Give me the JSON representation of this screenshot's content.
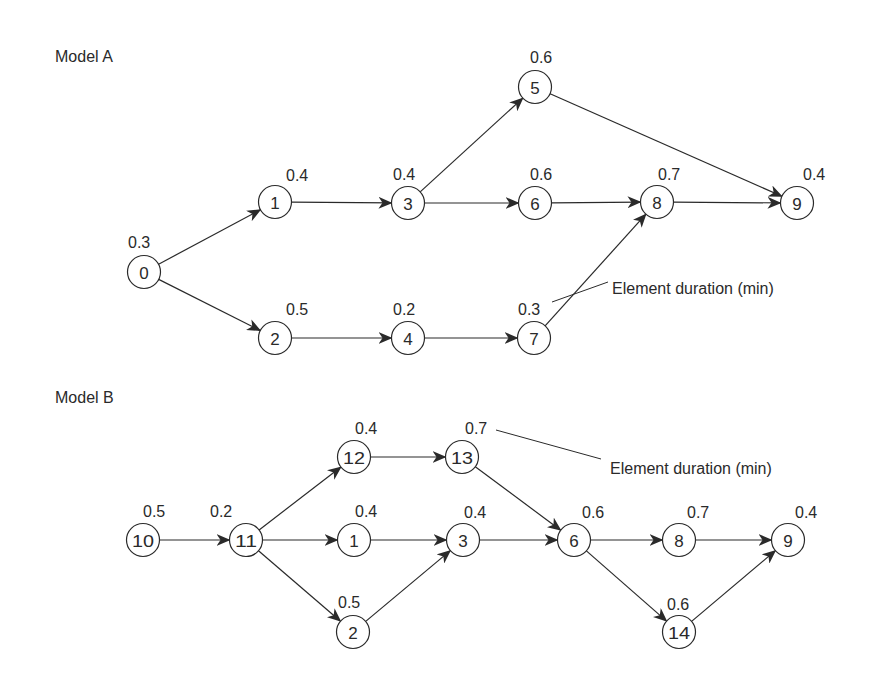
{
  "colors": {
    "ink": "#2a2a2a",
    "background": "#ffffff"
  },
  "node_radius": 16.5,
  "models": [
    {
      "id": "A",
      "title": "Model A",
      "title_pos": [
        55,
        62
      ],
      "nodes": [
        {
          "id": "0",
          "x": 144,
          "y": 272,
          "duration": "0.3",
          "label_pos": [
            128,
            248
          ]
        },
        {
          "id": "1",
          "x": 275,
          "y": 202,
          "duration": "0.4",
          "label_pos": [
            286,
            181
          ]
        },
        {
          "id": "2",
          "x": 275,
          "y": 338,
          "duration": "0.5",
          "label_pos": [
            286,
            315
          ]
        },
        {
          "id": "3",
          "x": 408,
          "y": 203,
          "duration": "0.4",
          "label_pos": [
            393,
            180
          ]
        },
        {
          "id": "4",
          "x": 408,
          "y": 338,
          "duration": "0.2",
          "label_pos": [
            393,
            315
          ]
        },
        {
          "id": "5",
          "x": 535,
          "y": 87,
          "duration": "0.6",
          "label_pos": [
            530,
            63
          ]
        },
        {
          "id": "6",
          "x": 535,
          "y": 203,
          "duration": "0.6",
          "label_pos": [
            530,
            180
          ]
        },
        {
          "id": "7",
          "x": 534,
          "y": 338,
          "duration": "0.3",
          "label_pos": [
            518,
            315
          ]
        },
        {
          "id": "8",
          "x": 657,
          "y": 202,
          "duration": "0.7",
          "label_pos": [
            658,
            180
          ]
        },
        {
          "id": "9",
          "x": 797,
          "y": 203,
          "duration": "0.4",
          "label_pos": [
            803,
            180
          ]
        }
      ],
      "edges": [
        [
          "0",
          "1"
        ],
        [
          "0",
          "2"
        ],
        [
          "1",
          "3"
        ],
        [
          "2",
          "4"
        ],
        [
          "3",
          "5"
        ],
        [
          "3",
          "6"
        ],
        [
          "4",
          "7"
        ],
        [
          "5",
          "9"
        ],
        [
          "6",
          "8"
        ],
        [
          "7",
          "8"
        ],
        [
          "8",
          "9"
        ]
      ],
      "annotation": {
        "text": "Element duration (min)",
        "text_pos": [
          612,
          294
        ],
        "leader": [
          [
            552,
            302
          ],
          [
            608,
            282
          ]
        ]
      }
    },
    {
      "id": "B",
      "title": "Model B",
      "title_pos": [
        55,
        403
      ],
      "nodes": [
        {
          "id": "10",
          "x": 143,
          "y": 540,
          "duration": "0.5",
          "label_pos": [
            143,
            517
          ]
        },
        {
          "id": "11",
          "x": 246,
          "y": 540,
          "duration": "0.2",
          "label_pos": [
            210,
            517
          ]
        },
        {
          "id": "12",
          "x": 354,
          "y": 457,
          "duration": "0.4",
          "label_pos": [
            355,
            434
          ]
        },
        {
          "id": "1",
          "x": 354,
          "y": 540,
          "duration": "0.4",
          "label_pos": [
            355,
            517
          ]
        },
        {
          "id": "2",
          "x": 353,
          "y": 632,
          "duration": "0.5",
          "label_pos": [
            338,
            608
          ]
        },
        {
          "id": "13",
          "x": 462,
          "y": 457,
          "duration": "0.7",
          "label_pos": [
            465,
            434
          ]
        },
        {
          "id": "3",
          "x": 463,
          "y": 540,
          "duration": "0.4",
          "label_pos": [
            464,
            518
          ]
        },
        {
          "id": "6",
          "x": 574,
          "y": 540,
          "duration": "0.6",
          "label_pos": [
            582,
            518
          ]
        },
        {
          "id": "8",
          "x": 679,
          "y": 540,
          "duration": "0.7",
          "label_pos": [
            687,
            518
          ]
        },
        {
          "id": "14",
          "x": 679,
          "y": 632,
          "duration": "0.6",
          "label_pos": [
            667,
            610
          ]
        },
        {
          "id": "9",
          "x": 788,
          "y": 540,
          "duration": "0.4",
          "label_pos": [
            795,
            518
          ]
        }
      ],
      "edges": [
        [
          "10",
          "11"
        ],
        [
          "11",
          "12"
        ],
        [
          "11",
          "1"
        ],
        [
          "11",
          "2"
        ],
        [
          "12",
          "13"
        ],
        [
          "1",
          "3"
        ],
        [
          "2",
          "3"
        ],
        [
          "13",
          "6"
        ],
        [
          "3",
          "6"
        ],
        [
          "6",
          "8"
        ],
        [
          "6",
          "14"
        ],
        [
          "8",
          "9"
        ],
        [
          "14",
          "9"
        ]
      ],
      "annotation": {
        "text": "Element duration (min)",
        "text_pos": [
          610,
          474
        ],
        "leader": [
          [
            496,
            430
          ],
          [
            601,
            459
          ]
        ]
      }
    }
  ]
}
